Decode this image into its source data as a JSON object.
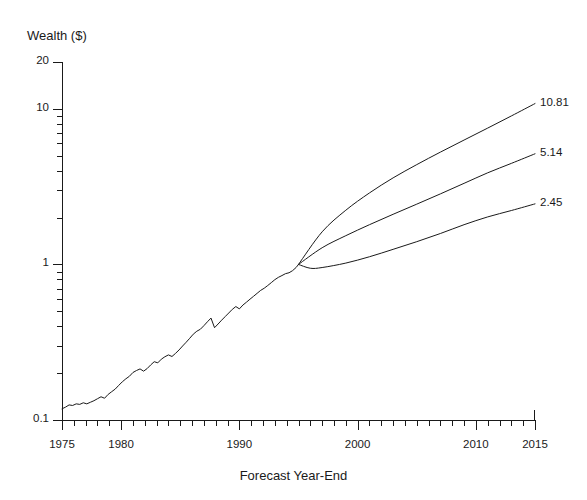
{
  "chart_data": {
    "type": "line",
    "title": "",
    "xlabel": "Forecast Year-End",
    "ylabel": "Wealth ($)",
    "yscale": "log",
    "ylim": [
      0.1,
      20
    ],
    "xlim": [
      1975,
      2015
    ],
    "grid": false,
    "legend": null,
    "y_tick_labels": [
      "20",
      "10",
      "1",
      "0.1"
    ],
    "y_tick_values": [
      20,
      10,
      1,
      0.1
    ],
    "y_minor_ticks": [
      9,
      8,
      7,
      6,
      5,
      4,
      3,
      2,
      0.9,
      0.8,
      0.7,
      0.6,
      0.5,
      0.4,
      0.3,
      0.2
    ],
    "x_tick_labels": [
      "1975",
      "1980",
      "1990",
      "2000",
      "2010",
      "2015"
    ],
    "x_tick_values": [
      1975,
      1980,
      1990,
      2000,
      2010,
      2015
    ],
    "x_minor_tick_step": 1,
    "series": [
      {
        "name": "historical",
        "kind": "historical",
        "x": [
          1975.0,
          1975.3,
          1975.6,
          1975.9,
          1976.2,
          1976.5,
          1976.8,
          1977.1,
          1977.4,
          1977.7,
          1978.0,
          1978.3,
          1978.6,
          1978.9,
          1979.2,
          1979.5,
          1979.8,
          1980.1,
          1980.4,
          1980.7,
          1981.0,
          1981.3,
          1981.6,
          1981.9,
          1982.2,
          1982.5,
          1982.8,
          1983.1,
          1983.4,
          1983.7,
          1984.0,
          1984.3,
          1984.6,
          1984.9,
          1985.2,
          1985.5,
          1985.8,
          1986.1,
          1986.4,
          1986.7,
          1987.0,
          1987.3,
          1987.6,
          1987.9,
          1988.2,
          1988.5,
          1988.8,
          1989.1,
          1989.4,
          1989.7,
          1990.0,
          1990.3,
          1990.6,
          1990.9,
          1991.2,
          1991.5,
          1991.8,
          1992.1,
          1992.4,
          1992.7,
          1993.0,
          1993.3,
          1993.6,
          1993.9,
          1994.2,
          1994.5,
          1994.8,
          1995.0
        ],
        "y": [
          0.118,
          0.121,
          0.125,
          0.124,
          0.127,
          0.126,
          0.129,
          0.127,
          0.13,
          0.133,
          0.137,
          0.141,
          0.138,
          0.146,
          0.152,
          0.158,
          0.167,
          0.176,
          0.184,
          0.191,
          0.202,
          0.208,
          0.213,
          0.206,
          0.214,
          0.226,
          0.237,
          0.233,
          0.246,
          0.255,
          0.262,
          0.256,
          0.268,
          0.282,
          0.299,
          0.316,
          0.335,
          0.356,
          0.372,
          0.383,
          0.404,
          0.428,
          0.452,
          0.392,
          0.414,
          0.438,
          0.462,
          0.487,
          0.514,
          0.536,
          0.518,
          0.548,
          0.572,
          0.598,
          0.624,
          0.652,
          0.681,
          0.703,
          0.732,
          0.764,
          0.798,
          0.826,
          0.848,
          0.872,
          0.884,
          0.912,
          0.956,
          1.0
        ]
      },
      {
        "name": "upper-forecast",
        "kind": "forecast",
        "endpoint_value": 10.81,
        "endpoint_label": "10.81",
        "x": [
          1995,
          1997,
          1999,
          2001,
          2003,
          2005,
          2007,
          2009,
          2011,
          2013,
          2015
        ],
        "y": [
          1.0,
          1.62,
          2.23,
          2.88,
          3.6,
          4.38,
          5.27,
          6.3,
          7.52,
          9.0,
          10.81
        ]
      },
      {
        "name": "middle-forecast",
        "kind": "forecast",
        "endpoint_value": 5.14,
        "endpoint_label": "5.14",
        "x": [
          1995,
          1997,
          1999,
          2001,
          2003,
          2005,
          2007,
          2009,
          2011,
          2013,
          2015
        ],
        "y": [
          1.0,
          1.28,
          1.53,
          1.8,
          2.1,
          2.44,
          2.84,
          3.32,
          3.88,
          4.46,
          5.14
        ]
      },
      {
        "name": "lower-forecast",
        "kind": "forecast",
        "endpoint_value": 2.45,
        "endpoint_label": "2.45",
        "x": [
          1995,
          1996,
          1997,
          1999,
          2001,
          2003,
          2005,
          2007,
          2009,
          2011,
          2013,
          2015
        ],
        "y": [
          1.0,
          0.945,
          0.955,
          1.02,
          1.12,
          1.25,
          1.4,
          1.58,
          1.8,
          2.02,
          2.22,
          2.45
        ]
      }
    ]
  },
  "axis": {
    "y_title": "Wealth ($)",
    "x_title": "Forecast Year-End"
  }
}
